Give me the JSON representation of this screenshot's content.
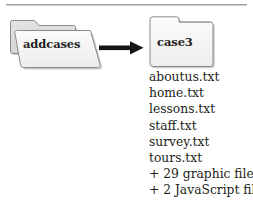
{
  "diagram": {
    "type": "folder-copy-flow",
    "top_rule": "horizontal-rule",
    "source_folder": {
      "name": "addcases",
      "icon": "open-folder-icon",
      "label": "addcases"
    },
    "arrow": {
      "icon": "right-arrow-icon",
      "direction": "right",
      "color": "#1a1a1a"
    },
    "target_folder": {
      "name": "case3",
      "icon": "closed-folder-icon",
      "label": "case3"
    },
    "contents": {
      "title": "case3 folder contents",
      "items": [
        "aboutus.txt",
        "home.txt",
        "lessons.txt",
        "staff.txt",
        "survey.txt",
        "tours.txt",
        "+ 29 graphic files",
        "+ 2 JavaScript files"
      ]
    },
    "colors": {
      "folder_fill": "#f2f2f2",
      "folder_stroke": "#8a8a8a",
      "folder_shadow": "#c9c9c9",
      "text": "#231f20",
      "background": "#ffffff"
    }
  }
}
